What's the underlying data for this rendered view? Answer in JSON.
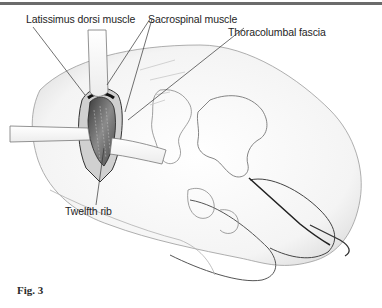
{
  "figure": {
    "caption": "Fig. 3",
    "labels": [
      {
        "id": "latissimus",
        "text": "Latissimus dorsi muscle"
      },
      {
        "id": "sacrospinal",
        "text": "Sacrospinal muscle"
      },
      {
        "id": "thoracolumbal",
        "text": "Thoracolumbal fascia"
      },
      {
        "id": "twelfth-rib",
        "text": "Twelfth rib"
      }
    ]
  },
  "colors": {
    "rule": "#6b6b6b",
    "ink": "#1e1e1e",
    "shade": "#9a9a9a"
  }
}
